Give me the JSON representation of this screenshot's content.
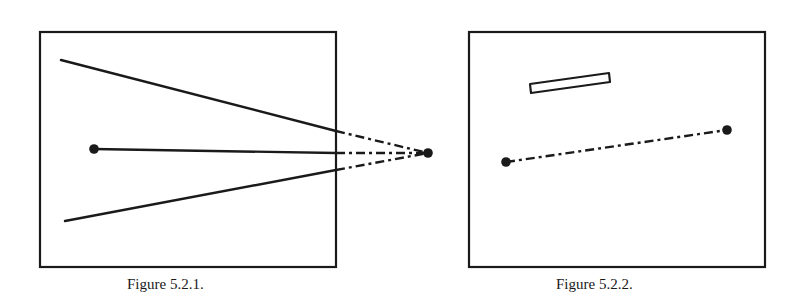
{
  "figures": [
    {
      "caption": "Figure 5.2.1.",
      "frame": {
        "x": 40,
        "y": 32,
        "width": 296,
        "height": 235
      },
      "solid_lines": [
        {
          "from": [
            61,
            60
          ],
          "to": [
            336,
            131
          ]
        },
        {
          "from": [
            94,
            149
          ],
          "to": [
            336,
            153
          ]
        },
        {
          "from": [
            65,
            221
          ],
          "to": [
            336,
            170
          ]
        }
      ],
      "dashed_lines": [
        {
          "from": [
            336,
            131
          ],
          "to": [
            428,
            153
          ]
        },
        {
          "from": [
            336,
            153
          ],
          "to": [
            428,
            153
          ]
        },
        {
          "from": [
            336,
            170
          ],
          "to": [
            428,
            153
          ]
        }
      ],
      "points": [
        [
          94,
          149
        ],
        [
          428,
          153
        ]
      ]
    },
    {
      "caption": "Figure 5.2.2.",
      "frame": {
        "x": 469,
        "y": 32,
        "width": 296,
        "height": 235
      },
      "bar": {
        "points": "530,84 609,73 610,82 531,93"
      },
      "dashed_lines": [
        {
          "from": [
            506,
            162
          ],
          "to": [
            727,
            130
          ]
        }
      ],
      "points": [
        [
          506,
          162
        ],
        [
          727,
          130
        ]
      ]
    }
  ],
  "colors": {
    "ink": "#1a1a1a",
    "background": "#ffffff"
  }
}
